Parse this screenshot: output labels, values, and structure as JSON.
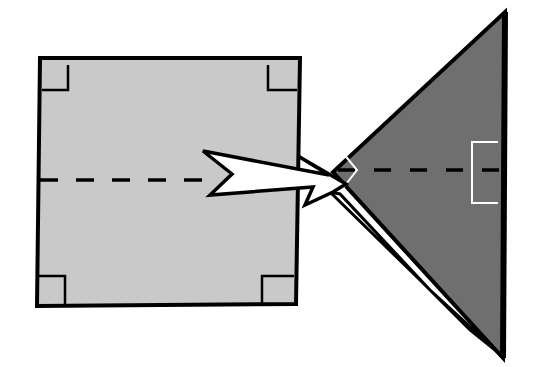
{
  "diagram": {
    "colors": {
      "background": "#ffffff",
      "square_fill": "#c9c9c9",
      "triangle_fill": "#6f6f6f",
      "outline": "#000000",
      "arrow_fill": "#ffffff",
      "triangle_marker": "#ffffff"
    },
    "square": {
      "corners": [
        [
          40,
          58
        ],
        [
          300,
          58
        ],
        [
          296,
          304
        ],
        [
          37,
          306
        ]
      ],
      "right_angle_markers": 4,
      "dashed_line": {
        "from": [
          40,
          180
        ],
        "to": [
          210,
          180
        ]
      }
    },
    "triangle": {
      "vertices": [
        [
          505,
          12
        ],
        [
          503,
          358
        ],
        [
          333,
          172
        ]
      ],
      "dashed_line": {
        "from": [
          335,
          170
        ],
        "to": [
          503,
          170
        ]
      },
      "apex_angle_marker": "chevron",
      "right_angle_bracket": {
        "x": 472,
        "y_top": 142,
        "y_bottom": 203
      }
    },
    "arrow": {
      "direction": "left-to-right",
      "shape": "jagged-lightning"
    }
  }
}
